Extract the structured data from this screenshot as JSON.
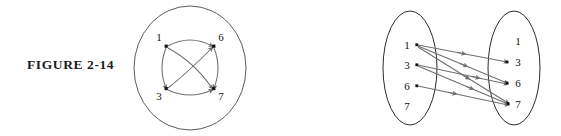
{
  "page": {
    "background_color": "#ffffff",
    "ink_color": "#1c1c1c",
    "edge_color": "#6f6f6f",
    "outline_color": "#4a4a4a"
  },
  "figures": [
    {
      "id": "figure-2-14",
      "caption": "FIGURE  2-14",
      "type": "directed-graph-in-circle",
      "description": "Directed graph drawn inside a single large circle",
      "nodes": [
        {
          "id": "n1",
          "label": "1",
          "position": "top-left",
          "cx": 39,
          "cy": 38
        },
        {
          "id": "n6",
          "label": "6",
          "position": "top-right",
          "cx": 91,
          "cy": 38
        },
        {
          "id": "n3",
          "label": "3",
          "position": "bottom-left",
          "cx": 39,
          "cy": 86
        },
        {
          "id": "n7",
          "label": "7",
          "position": "bottom-right",
          "cx": 91,
          "cy": 86
        }
      ],
      "edges": [
        {
          "from": "1",
          "to": "6",
          "shape": "arc-top"
        },
        {
          "from": "1",
          "to": "3",
          "shape": "arc-left"
        },
        {
          "from": "1",
          "to": "7",
          "shape": "diagonal"
        },
        {
          "from": "3",
          "to": "6",
          "shape": "diagonal"
        },
        {
          "from": "3",
          "to": "7",
          "shape": "arc-bottom"
        },
        {
          "from": "6",
          "to": "7",
          "shape": "arc-right"
        }
      ],
      "outer_circle": {
        "cx": 65,
        "cy": 62,
        "r": 58
      }
    },
    {
      "id": "figure-2-15",
      "caption": "FIGURE  2-15",
      "type": "bipartite-arrow-diagram",
      "description": "Two ellipses each holding the elements 1, 3, 6, 7 with arrows from left to right",
      "left_set": {
        "label": "domain",
        "items": [
          "1",
          "3",
          "6",
          "7"
        ]
      },
      "right_set": {
        "label": "codomain",
        "items": [
          "1",
          "3",
          "6",
          "7"
        ]
      },
      "edges": [
        {
          "from": "1",
          "to": "3"
        },
        {
          "from": "1",
          "to": "6"
        },
        {
          "from": "1",
          "to": "7"
        },
        {
          "from": "3",
          "to": "6"
        },
        {
          "from": "3",
          "to": "7"
        },
        {
          "from": "6",
          "to": "7"
        }
      ]
    }
  ]
}
